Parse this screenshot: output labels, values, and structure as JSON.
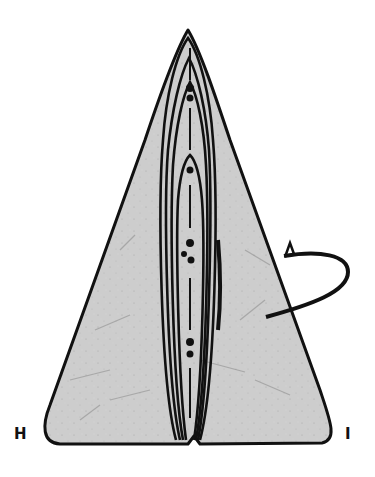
{
  "diagram": {
    "type": "origami-fold-diagram",
    "paper_color": "#cfcfcf",
    "line_color": "#111111",
    "labels": {
      "left_corner": "H",
      "right_corner": "I"
    },
    "elements": [
      {
        "name": "paper-triangle",
        "description": "grey textured triangular paper with rounded bottom corners"
      },
      {
        "name": "nested-folded-layers",
        "description": "narrow nested arch-shaped flaps along center"
      },
      {
        "name": "valley-fold-line",
        "description": "dash-dot center line"
      },
      {
        "name": "turn-over-arrow",
        "description": "looping arrow on right edge indicating turn over"
      }
    ]
  }
}
